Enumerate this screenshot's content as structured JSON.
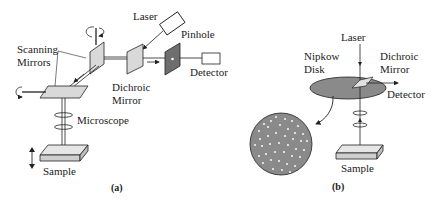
{
  "panel_a": {
    "labels": {
      "laser": "Laser",
      "pinhole": "Pinhole",
      "scanning_mirrors_1": "Scanning",
      "scanning_mirrors_2": "Mirrors",
      "detector": "Detector",
      "dichroic_1": "Dichroic",
      "dichroic_2": "Mirror",
      "microscope": "Microscope",
      "sample": "Sample"
    },
    "caption": "(a)"
  },
  "panel_b": {
    "labels": {
      "laser": "Laser",
      "nipkow_1": "Nipkow",
      "nipkow_2": "Disk",
      "dichroic_1": "Dichroic",
      "dichroic_2": "Mirror",
      "detector": "Detector",
      "sample": "Sample"
    },
    "caption": "(b)"
  },
  "colors": {
    "line": "#222222",
    "mirror_fill": "#d9d9d9",
    "pinhole_fill": "#6e6e6e",
    "disk_fill": "#8a8a8a",
    "sample_fill": "#e6e6e6"
  }
}
